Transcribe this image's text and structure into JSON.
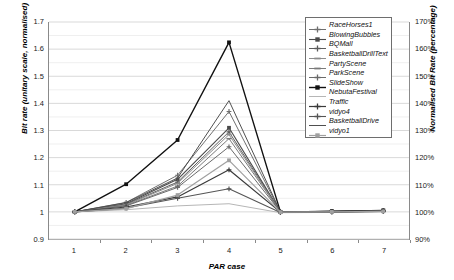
{
  "chart_data": {
    "type": "line",
    "title": "",
    "xlabel": "PAR case",
    "ylabel": "Bit rate (unitary scale, normalised)",
    "y2label": "Normalised Bit Rate (percentage)",
    "x": [
      1,
      2,
      3,
      4,
      5,
      6,
      7
    ],
    "categories": [
      "1",
      "2",
      "3",
      "4",
      "5",
      "6",
      "7"
    ],
    "xtick_labels": [
      "1",
      "2",
      "3",
      "4",
      "5",
      "6",
      "7"
    ],
    "ylim": [
      0.9,
      1.7
    ],
    "ytick_labels": [
      "0.9",
      "1",
      "1.1",
      "1.2",
      "1.3",
      "1.4",
      "1.5",
      "1.6",
      "1.7"
    ],
    "ytick_values": [
      0.9,
      1.0,
      1.1,
      1.2,
      1.3,
      1.4,
      1.5,
      1.6,
      1.7
    ],
    "y2lim": [
      90,
      170
    ],
    "y2tick_labels": [
      "90%",
      "100%",
      "110%",
      "120%",
      "130%",
      "140%",
      "150%",
      "160%",
      "170%"
    ],
    "y2tick_values": [
      90,
      100,
      110,
      120,
      130,
      140,
      150,
      160,
      170
    ],
    "grid": true,
    "minor_grid_step": 0.05,
    "legend_position": "top-right",
    "series": [
      {
        "name": "RaceHorses1",
        "color": "#6f6f6f",
        "width": 1.0,
        "marker": "cross",
        "values": [
          1.0,
          1.035,
          1.135,
          1.37,
          1.0,
          1.002,
          1.005
        ]
      },
      {
        "name": "BlowingBubbles",
        "color": "#4a4a4a",
        "width": 1.1,
        "marker": "square",
        "values": [
          1.0,
          1.03,
          1.12,
          1.31,
          1.0,
          1.002,
          1.005
        ]
      },
      {
        "name": "BQMall",
        "color": "#5c5c5c",
        "width": 1.0,
        "marker": "cross",
        "values": [
          1.0,
          1.028,
          1.11,
          1.295,
          1.0,
          1.002,
          1.004
        ]
      },
      {
        "name": "BasketballDrillText",
        "color": "#8c8c8c",
        "width": 1.0,
        "marker": "dash",
        "values": [
          1.0,
          1.026,
          1.105,
          1.285,
          1.0,
          1.001,
          1.004
        ]
      },
      {
        "name": "PartyScene",
        "color": "#7a7a7a",
        "width": 1.0,
        "marker": "dash",
        "values": [
          1.0,
          1.024,
          1.095,
          1.27,
          1.0,
          1.001,
          1.004
        ]
      },
      {
        "name": "ParkScene",
        "color": "#6a6a6a",
        "width": 1.0,
        "marker": "cross",
        "values": [
          1.0,
          1.022,
          1.09,
          1.24,
          1.0,
          1.001,
          1.004
        ]
      },
      {
        "name": "SlideShow",
        "color": "#111111",
        "width": 1.4,
        "marker": "square",
        "values": [
          1.0,
          1.102,
          1.265,
          1.625,
          1.0,
          1.002,
          1.005
        ]
      },
      {
        "name": "NebutaFestival",
        "color": "#b6b6b6",
        "width": 1.0,
        "marker": "line",
        "values": [
          1.0,
          1.008,
          1.022,
          1.03,
          0.997,
          0.998,
          1.0
        ]
      },
      {
        "name": "Traffic",
        "color": "#3a3a3a",
        "width": 1.2,
        "marker": "cross",
        "values": [
          1.0,
          1.018,
          1.055,
          1.155,
          0.999,
          1.0,
          1.003
        ]
      },
      {
        "name": "vidyo4",
        "color": "#555555",
        "width": 1.1,
        "marker": "cross",
        "values": [
          1.0,
          1.014,
          1.05,
          1.085,
          0.998,
          0.999,
          1.002
        ]
      },
      {
        "name": "BasketballDrive",
        "color": "#4f4f4f",
        "width": 1.0,
        "marker": "line",
        "values": [
          1.0,
          1.034,
          1.125,
          1.41,
          1.0,
          1.002,
          1.005
        ]
      },
      {
        "name": "vidyo1",
        "color": "#a0a0a0",
        "width": 1.2,
        "marker": "square",
        "values": [
          1.0,
          1.012,
          1.062,
          1.19,
          0.999,
          1.0,
          1.002
        ]
      }
    ]
  },
  "axes": {
    "x_title": "PAR case",
    "y_left_title": "Bit rate (unitary scale, normalised)",
    "y_right_title": "Normalised Bit Rate (percentage)"
  },
  "colors": {
    "frame": "#8a8a8a",
    "major_grid": "#d9d9d9",
    "minor_grid": "#efefef",
    "background": "#ffffff",
    "legend_border": "#6e6e6e",
    "text": "#111111"
  }
}
